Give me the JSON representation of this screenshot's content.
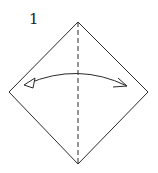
{
  "diagram": {
    "type": "origami-step",
    "step_number": "1",
    "shape": "square-on-point",
    "colors": {
      "stroke": "#2a2a2a",
      "background": "#ffffff"
    },
    "elements": [
      {
        "name": "paper-outline",
        "kind": "diamond",
        "vertices": [
          [
            78,
            22
          ],
          [
            148,
            92
          ],
          [
            78,
            164
          ],
          [
            9,
            92
          ]
        ]
      },
      {
        "name": "valley-fold-line",
        "kind": "dashed-line",
        "from": [
          78,
          22
        ],
        "to": [
          78,
          164
        ]
      },
      {
        "name": "fold-and-unfold-arrow",
        "kind": "double-headed-arc",
        "from": [
          25,
          85
        ],
        "to": [
          128,
          86
        ],
        "meaning": "fold in half and unfold"
      }
    ]
  }
}
